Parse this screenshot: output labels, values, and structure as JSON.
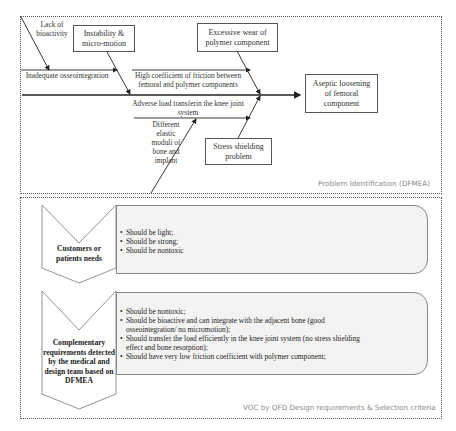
{
  "fishbone": {
    "caption": "Problem Identification (DFMEA)",
    "effect": "Aseptic loosening of femoral component",
    "causes": {
      "lack_of_bioactivity": "Lack of bioactivity",
      "instability": "Instability & micro-motion",
      "excessive_wear": "Excessive wear of polymer component",
      "inadequate_osseointegration": "Inadequate osseointegration",
      "high_friction": "High coefficient of friction between femoral and polymer components",
      "adverse_load": "Adverse load transferin the knee joint system",
      "different_moduli": "Different elastic moduli of bone and implant",
      "stress_shielding": "Stress shielding problem"
    }
  },
  "voc": {
    "caption": "VOC by QFD Design requirements & Selection criteria",
    "rows": [
      {
        "label": "Customers or patients needs",
        "items": [
          "Should be light;",
          "Should be strong;",
          "Should be nontoxic"
        ]
      },
      {
        "label": "Complementary requirements detected by the medical and design team based on DFMEA",
        "items": [
          "Should be nontoxic;",
          "Should be bioactive and can integrate with the adjacent bone (good osseointegration/ no micromotion);",
          "Should transfer the load efficiently in the knee joint system (no stress shielding effect and bone resorption);",
          "Should have very low friction coefficient with polymer component;"
        ]
      }
    ]
  }
}
